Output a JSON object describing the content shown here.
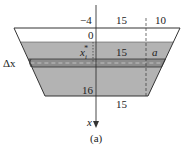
{
  "figure": {
    "caption": "(a)",
    "top_labels": {
      "left": "−4",
      "middle": "15",
      "right": "10"
    },
    "surface_label": "0",
    "strip_depth_label": "x",
    "strip_depth_sub": "i",
    "strip_depth_sup": "*",
    "mid_width_label": "15",
    "a_label": "a",
    "delta_x_label": "Δx",
    "bottom_depth_label": "16",
    "bottom_width_label": "15",
    "axis_label": "x"
  },
  "colors": {
    "water": "#b3b3b3",
    "strip": "#8c8c8c",
    "outline": "#333333",
    "background": "#ffffff"
  }
}
